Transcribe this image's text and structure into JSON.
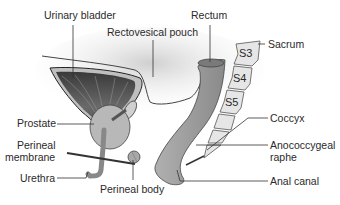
{
  "diagram": {
    "labels": {
      "urinary_bladder": "Urinary bladder",
      "rectovesical_pouch": "Rectovesical pouch",
      "rectum": "Rectum",
      "sacrum": "Sacrum",
      "prostate": "Prostate",
      "perineal_membrane_line1": "Perineal",
      "perineal_membrane_line2": "membrane",
      "urethra": "Urethra",
      "perineal_body": "Perineal body",
      "coccyx": "Coccyx",
      "anococcygeal_raphe_line1": "Anococcygeal",
      "anococcygeal_raphe_line2": "raphe",
      "anal_canal": "Anal canal"
    },
    "vertebrae": {
      "s3": "S3",
      "s4": "S4",
      "s5": "S5"
    },
    "colors": {
      "peritoneum_shade": "#d9d9d9",
      "bladder_wall": "#8a8a8a",
      "bladder_muscle": "#4a4a4a",
      "rectum_fill": "#9c9c9c",
      "bone_fill": "#e6e6e6",
      "leader_line": "#333333"
    }
  }
}
